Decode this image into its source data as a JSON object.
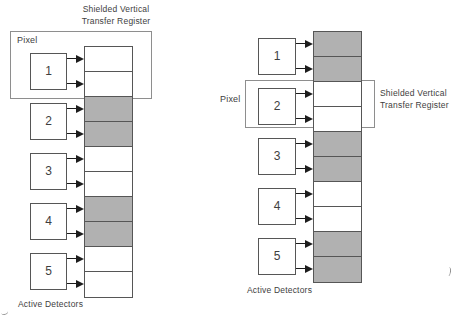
{
  "figure": {
    "description_note": "",
    "colors": {
      "background": "#ffffff",
      "cell_gray": "#b1b1b1",
      "cell_white": "#ffffff",
      "line": "#565656",
      "enclosure_border": "#8e8e8e",
      "arrow": "#1d1d1d",
      "text": "#3e3e3e"
    }
  },
  "left_diagram": {
    "title_lines": [
      "Shielded Vertical",
      "Transfer Register"
    ],
    "pixel_label": "Pixel",
    "detectors": [
      "1",
      "2",
      "3",
      "4",
      "5"
    ],
    "register_cells": [
      "white",
      "white",
      "gray",
      "gray",
      "white",
      "white",
      "gray",
      "gray",
      "white",
      "white"
    ],
    "highlighted_detector": "1",
    "active_detectors_label": "Active Detectors"
  },
  "right_diagram": {
    "register_label_lines": [
      "Shielded Vertical",
      "Transfer Register"
    ],
    "pixel_label": "Pixel",
    "detectors": [
      "1",
      "2",
      "3",
      "4",
      "5"
    ],
    "register_cells": [
      "gray",
      "gray",
      "white",
      "white",
      "gray",
      "gray",
      "white",
      "white",
      "gray",
      "gray"
    ],
    "highlighted_detector": "2",
    "active_detectors_label": "Active Detectors"
  }
}
